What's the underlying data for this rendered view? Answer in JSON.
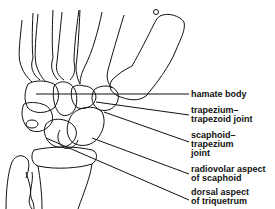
{
  "figure": {
    "line_color": "#111111",
    "background": "#ffffff"
  },
  "labels": [
    {
      "id": "hamate-body",
      "lines": [
        "hamate body"
      ]
    },
    {
      "id": "trapezium-trapezoid-joint",
      "lines": [
        "trapezium–",
        "trapezoid joint"
      ]
    },
    {
      "id": "scaphoid-trapezium-joint",
      "lines": [
        "scaphoid–",
        "trapezium",
        "joint"
      ]
    },
    {
      "id": "radiovolar-aspect-scaphoid",
      "lines": [
        "radiovolar aspect",
        "of scaphoid"
      ]
    },
    {
      "id": "dorsal-aspect-triquetrum",
      "lines": [
        "dorsal aspect",
        "of triquetrum"
      ]
    }
  ]
}
